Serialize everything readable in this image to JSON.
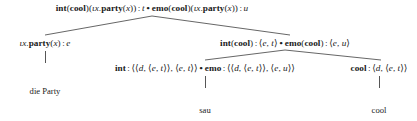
{
  "diagram": {
    "type": "syntactic-derivation-tree",
    "language": "German",
    "rows": {
      "root": {
        "id": "root-node",
        "x": 152,
        "y": 3,
        "text": "int(cool)(ιx.party(x)) : t • emo(cool)(ιx.party(x)) : u",
        "parts": [
          {
            "t": "int",
            "style": "bold"
          },
          {
            "t": "(",
            "style": "plain"
          },
          {
            "t": "cool",
            "style": "bold"
          },
          {
            "t": ")(",
            "style": "plain"
          },
          {
            "t": "ιx",
            "style": "ital"
          },
          {
            "t": ".",
            "style": "plain"
          },
          {
            "t": "party",
            "style": "bold"
          },
          {
            "t": "(",
            "style": "plain"
          },
          {
            "t": "x",
            "style": "ital"
          },
          {
            "t": ")) : ",
            "style": "plain"
          },
          {
            "t": "t",
            "style": "ital"
          },
          {
            "t": " • ",
            "style": "dot"
          },
          {
            "t": "emo",
            "style": "bold"
          },
          {
            "t": "(",
            "style": "plain"
          },
          {
            "t": "cool",
            "style": "bold"
          },
          {
            "t": ")(",
            "style": "plain"
          },
          {
            "t": "ιx",
            "style": "ital"
          },
          {
            "t": ".",
            "style": "plain"
          },
          {
            "t": "party",
            "style": "bold"
          },
          {
            "t": "(",
            "style": "plain"
          },
          {
            "t": "x",
            "style": "ital"
          },
          {
            "t": ")) : ",
            "style": "plain"
          },
          {
            "t": "u",
            "style": "ital"
          }
        ]
      },
      "left_branch": {
        "id": "np-node",
        "x": 45,
        "y": 38,
        "text": "ιx.party(x) : e"
      },
      "right_branch": {
        "id": "vp-node",
        "x": 285,
        "y": 38,
        "text": "int(cool) : ⟨e, t⟩ • emo(cool) : ⟨e, u⟩"
      },
      "lex_int": {
        "id": "int-lexical-node",
        "x": 205,
        "y": 63,
        "text": "int : ⟨⟨d, ⟨e, t⟩⟩, ⟨e, t⟩⟩ • emo : ⟨⟨d, ⟨e, t⟩⟩, ⟨e, u⟩⟩"
      },
      "lex_cool": {
        "id": "cool-lexical-node",
        "x": 379,
        "y": 63,
        "text": "cool : ⟨d, ⟨e, t⟩⟩"
      }
    },
    "leaves": [
      {
        "id": "leaf-die-party",
        "label": "die Party",
        "x": 45,
        "y": 86
      },
      {
        "id": "leaf-sau",
        "label": "sau",
        "x": 205,
        "y": 105
      },
      {
        "id": "leaf-cool",
        "label": "cool",
        "x": 379,
        "y": 105
      }
    ],
    "edges": [
      {
        "id": "edge-root-left",
        "x1": 152,
        "y1": 16,
        "x2": 45,
        "y2": 35
      },
      {
        "id": "edge-root-right",
        "x1": 152,
        "y1": 16,
        "x2": 290,
        "y2": 35
      },
      {
        "id": "edge-vp-left",
        "x1": 285,
        "y1": 50,
        "x2": 205,
        "y2": 60
      },
      {
        "id": "edge-vp-right",
        "x1": 285,
        "y1": 50,
        "x2": 381,
        "y2": 60
      }
    ],
    "verticals": [
      {
        "id": "vline-np-dieparty",
        "x": 45,
        "y": 51,
        "height": 12
      },
      {
        "id": "vline-int-sau",
        "x": 205,
        "y": 76,
        "height": 12
      },
      {
        "id": "vline-cool-cool",
        "x": 379,
        "y": 76,
        "height": 12
      }
    ],
    "colors": {
      "text": "#1a1a1a",
      "line": "#555555",
      "background": "#ffffff"
    }
  }
}
